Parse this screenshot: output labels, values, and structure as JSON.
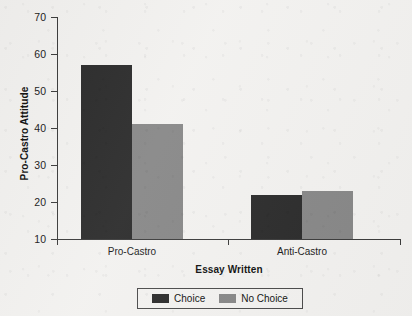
{
  "chart_data": {
    "type": "bar",
    "title": "",
    "xlabel": "Essay Written",
    "ylabel": "Pro-Castro Attitude",
    "categories": [
      "Pro-Castro",
      "Anti-Castro"
    ],
    "series": [
      {
        "name": "Choice",
        "color": "#2b2b2b",
        "values": [
          57,
          22
        ]
      },
      {
        "name": "No Choice",
        "color": "#878787",
        "values": [
          41,
          23
        ]
      }
    ],
    "ylim": [
      10,
      70
    ],
    "yticks": [
      10,
      20,
      30,
      40,
      50,
      60,
      70
    ],
    "ytick_labels": [
      "10",
      "20",
      "30",
      "40",
      "50",
      "60",
      "70"
    ],
    "grid": false,
    "legend_position": "bottom-center"
  },
  "legend": {
    "entries": [
      {
        "label": "Choice",
        "color": "#2b2b2b"
      },
      {
        "label": "No Choice",
        "color": "#878787"
      }
    ]
  },
  "colors": {
    "background": "#f2f1ef",
    "axis": "#3b3b3b",
    "text": "#111111",
    "series_choice": "#2b2b2b",
    "series_no_choice": "#878787"
  }
}
